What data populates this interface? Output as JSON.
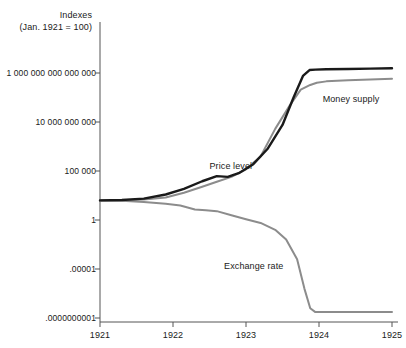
{
  "chart_data": {
    "type": "line",
    "title": "Indexes",
    "subtitle": "(Jan. 1921 = 100)",
    "xlabel": "",
    "ylabel": "Indexes (Jan. 1921 = 100)",
    "yscale": "log",
    "grid": false,
    "legend_position": "inline-annotations",
    "x_ticks": [
      "1921",
      "1922",
      "1923",
      "1924",
      "1925"
    ],
    "x_tick_values": [
      1921,
      1922,
      1923,
      1924,
      1925
    ],
    "xlim": [
      1921,
      1925
    ],
    "y_ticks": [
      "1 000 000 000 000 000",
      "10 000 000 000",
      "100 000",
      "1",
      ".00001",
      ".0000000001"
    ],
    "y_tick_values": [
      1000000000000000.0,
      10000000000.0,
      100000.0,
      1,
      1e-05,
      1e-10
    ],
    "ylim": [
      1e-10,
      1e+17
    ],
    "series": [
      {
        "name": "Price level",
        "color": "#1a1a1a",
        "x": [
          1921.0,
          1921.3,
          1921.6,
          1921.9,
          1922.15,
          1922.4,
          1922.6,
          1922.75,
          1922.9,
          1923.1,
          1923.3,
          1923.5,
          1923.65,
          1923.78,
          1923.87,
          1923.95,
          1924.1,
          1924.4,
          1924.7,
          1925.0
        ],
        "y": [
          100,
          110,
          150,
          400,
          1500,
          9000,
          30000,
          25000,
          60000,
          500000,
          20000000,
          5000000000,
          3000000000000.0,
          500000000000000.0,
          2000000000000000.0,
          2200000000000000.0,
          2400000000000000.0,
          2600000000000000.0,
          2800000000000000.0,
          3000000000000000.0
        ],
        "label_x": 1922.5,
        "label_y": 300000
      },
      {
        "name": "Money supply",
        "color": "#8c8c8c",
        "x": [
          1921.0,
          1921.3,
          1921.6,
          1921.9,
          1922.15,
          1922.4,
          1922.6,
          1922.8,
          1923.0,
          1923.2,
          1923.4,
          1923.6,
          1923.75,
          1923.88,
          1923.97,
          1924.1,
          1924.4,
          1924.7,
          1925.0
        ],
        "y": [
          100,
          105,
          120,
          200,
          600,
          2500,
          8000,
          25000,
          150000,
          3000000,
          2000000000,
          500000000000.0,
          20000000000000.0,
          60000000000000.0,
          100000000000000.0,
          140000000000000.0,
          180000000000000.0,
          220000000000000.0,
          260000000000000.0
        ],
        "label_x": 1924.05,
        "label_y": 2000000000000.0
      },
      {
        "name": "Exchange rate",
        "color": "#8c8c8c",
        "x": [
          1921.0,
          1921.3,
          1921.6,
          1921.9,
          1922.1,
          1922.3,
          1922.45,
          1922.6,
          1922.8,
          1923.0,
          1923.2,
          1923.4,
          1923.55,
          1923.7,
          1923.8,
          1923.88,
          1923.95,
          1924.1,
          1924.5,
          1925.0
        ],
        "y": [
          100,
          90,
          70,
          45,
          30,
          12,
          10,
          8,
          3,
          1.2,
          0.5,
          0.1,
          0.01,
          0.0001,
          1e-07,
          1e-09,
          4e-10,
          4e-10,
          4e-10,
          4e-10
        ],
        "label_x": 1922.7,
        "label_y": 2e-05
      }
    ],
    "annotations": [
      {
        "text": "Price level",
        "series": "Price level"
      },
      {
        "text": "Money supply",
        "series": "Money supply"
      },
      {
        "text": "Exchange rate",
        "series": "Exchange rate"
      }
    ]
  },
  "axis": {
    "title_line1": "Indexes",
    "title_line2": "(Jan. 1921 = 100)"
  },
  "colors": {
    "price_level": "#1a1a1a",
    "money_supply": "#8c8c8c",
    "exchange_rate": "#8c8c8c",
    "axis": "#555555",
    "background": "#ffffff"
  }
}
